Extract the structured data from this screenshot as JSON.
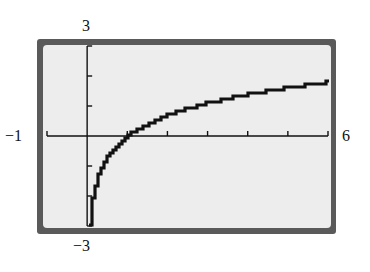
{
  "chart_data": {
    "type": "line",
    "title": "",
    "function": "y = ln(x)",
    "xlabel": "",
    "ylabel": "",
    "xlim": [
      -1,
      6
    ],
    "ylim": [
      -3,
      3
    ],
    "x_tick_step": 1,
    "y_tick_step": 1,
    "grid": false,
    "legend": null,
    "window_labels": {
      "xmin": "−1",
      "xmax": "6",
      "ymin": "−3",
      "ymax": "3"
    },
    "series": [
      {
        "name": "ln(x)",
        "x": [
          0.05,
          0.1,
          0.2,
          0.3,
          0.5,
          0.75,
          1,
          1.5,
          2,
          2.5,
          3,
          3.5,
          4,
          4.5,
          5,
          5.5,
          6
        ],
        "y": [
          -3.0,
          -2.3,
          -1.61,
          -1.2,
          -0.69,
          -0.29,
          0,
          0.41,
          0.69,
          0.92,
          1.1,
          1.25,
          1.39,
          1.5,
          1.61,
          1.7,
          1.79
        ]
      }
    ],
    "style": {
      "frame_color": "#5a5a5a",
      "screen_color": "#ededed",
      "curve_color": "#111111"
    }
  }
}
